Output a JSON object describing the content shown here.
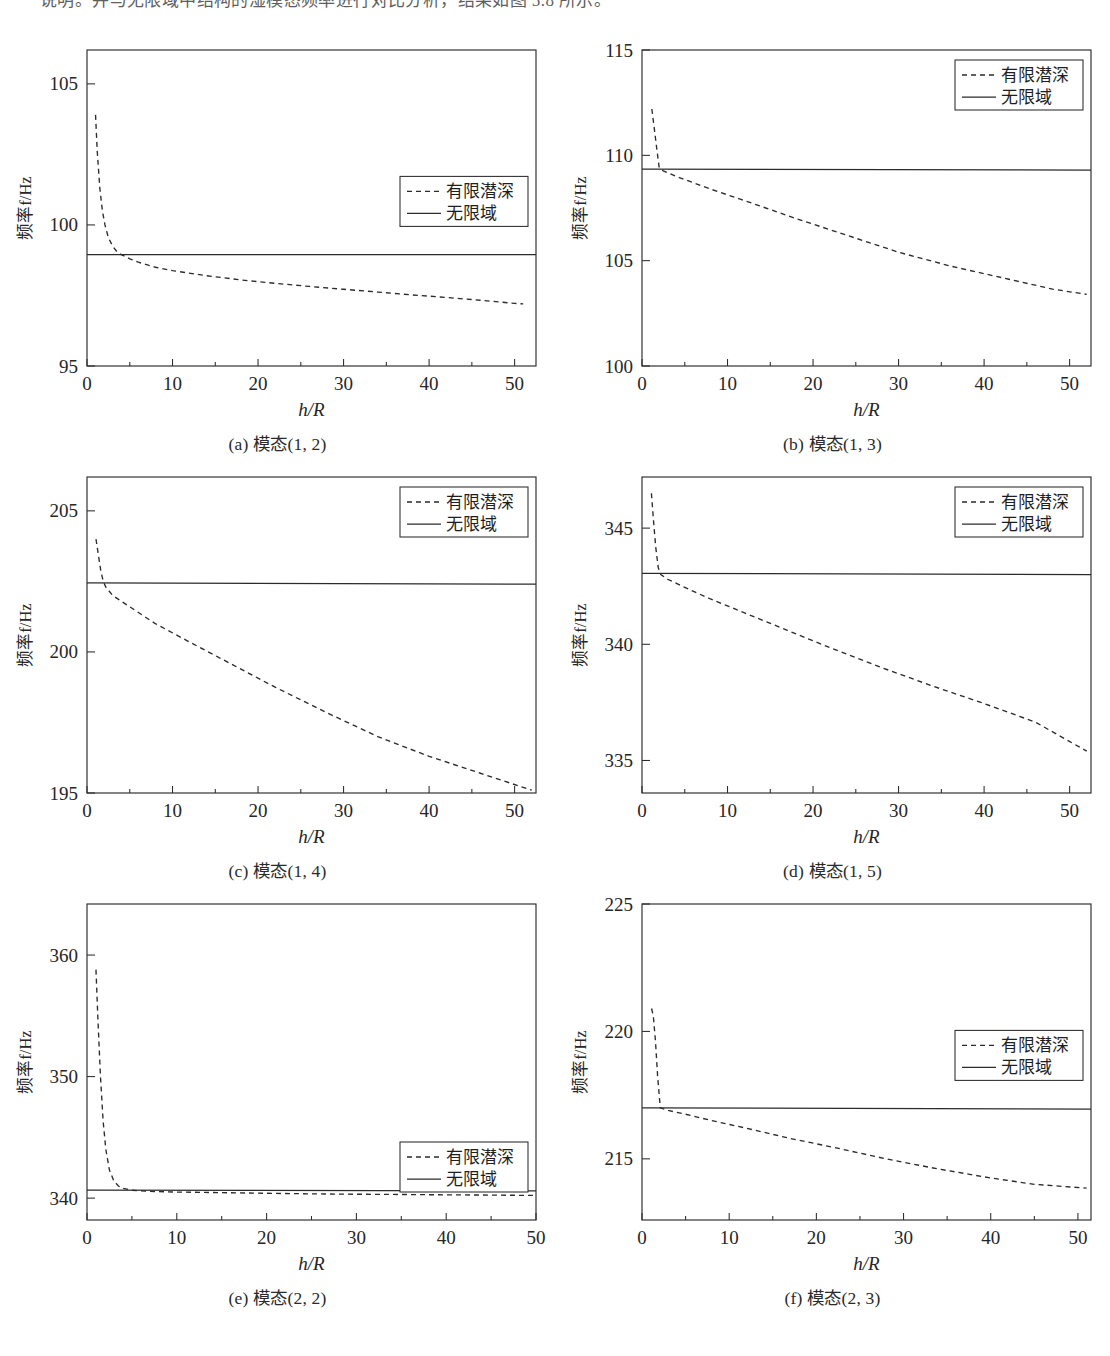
{
  "page": {
    "body_text_top": "说明。并与无限域中结构的湿模态频率进行对比分析，结果如图 5.8 所示。"
  },
  "legend": {
    "dashed_label": "有限潜深",
    "solid_label": "无限域"
  },
  "axes": {
    "xlabel": "h/R",
    "ylabel": "频率f/Hz"
  },
  "captions": {
    "a": "(a) 模态(1, 2)",
    "b": "(b) 模态(1, 3)",
    "c": "(c) 模态(1, 4)",
    "d": "(d) 模态(1, 5)",
    "e": "(e) 模态(2, 2)",
    "f": "(f) 模态(2, 3)"
  },
  "chart_data": [
    {
      "id": "a",
      "type": "line",
      "title": "(a) 模态(1, 2)",
      "xlabel": "h/R",
      "ylabel": "频率f/Hz",
      "xlim": [
        0,
        52.5
      ],
      "ylim": [
        95,
        106.2
      ],
      "xticks": [
        0,
        10,
        20,
        30,
        40,
        50
      ],
      "xtick_labels": [
        "0",
        "10",
        "20",
        "30",
        "40",
        "50"
      ],
      "yticks": [
        95,
        100,
        105
      ],
      "ytick_labels": [
        "95",
        "100",
        "105"
      ],
      "minor_xticks": [
        5,
        15,
        25,
        35,
        45
      ],
      "grid": false,
      "legend_position": "right-middle",
      "series": [
        {
          "name": "有限潜深",
          "style": "dashed",
          "x": [
            1,
            1.2,
            1.5,
            1.8,
            2.1,
            2.5,
            3,
            3.5,
            4,
            5,
            6,
            8,
            10,
            14,
            18,
            22,
            26,
            30,
            34,
            38,
            42,
            46,
            50,
            51
          ],
          "values": [
            103.9,
            102.6,
            101.3,
            100.5,
            100.0,
            99.55,
            99.25,
            99.05,
            98.95,
            98.8,
            98.68,
            98.5,
            98.38,
            98.2,
            98.05,
            97.93,
            97.82,
            97.72,
            97.62,
            97.52,
            97.43,
            97.33,
            97.22,
            97.2
          ]
        },
        {
          "name": "无限域",
          "style": "solid",
          "x": [
            0,
            52.5
          ],
          "values": [
            98.95,
            98.95
          ]
        }
      ]
    },
    {
      "id": "b",
      "type": "line",
      "title": "(b) 模态(1, 3)",
      "xlabel": "h/R",
      "ylabel": "频率f/Hz",
      "xlim": [
        0,
        52.5
      ],
      "ylim": [
        100,
        115
      ],
      "xticks": [
        0,
        10,
        20,
        30,
        40,
        50
      ],
      "xtick_labels": [
        "0",
        "10",
        "20",
        "30",
        "40",
        "50"
      ],
      "yticks": [
        100,
        105,
        110,
        115
      ],
      "ytick_labels": [
        "100",
        "105",
        "110",
        "115"
      ],
      "minor_xticks": [
        5,
        15,
        25,
        35,
        45
      ],
      "grid": false,
      "legend_position": "top-right",
      "series": [
        {
          "name": "有限潜深",
          "style": "dashed",
          "x": [
            1.15,
            1.4,
            1.7,
            2.0,
            2.3,
            4,
            8,
            12,
            18,
            24,
            30,
            36,
            42,
            48,
            52
          ],
          "values": [
            112.2,
            111.4,
            110.4,
            109.45,
            109.3,
            109.0,
            108.4,
            107.85,
            107.0,
            106.2,
            105.4,
            104.75,
            104.2,
            103.65,
            103.4
          ]
        },
        {
          "name": "无限域",
          "style": "solid",
          "x": [
            0,
            52.5
          ],
          "values": [
            109.35,
            109.3
          ]
        }
      ]
    },
    {
      "id": "c",
      "type": "line",
      "title": "(c) 模态(1, 4)",
      "xlabel": "h/R",
      "ylabel": "频率f/Hz",
      "xlim": [
        0,
        52.5
      ],
      "ylim": [
        195,
        206.2
      ],
      "xticks": [
        0,
        10,
        20,
        30,
        40,
        50
      ],
      "xtick_labels": [
        "0",
        "10",
        "20",
        "30",
        "40",
        "50"
      ],
      "yticks": [
        195,
        200,
        205
      ],
      "ytick_labels": [
        "195",
        "200",
        "205"
      ],
      "minor_xticks": [
        5,
        15,
        25,
        35,
        45
      ],
      "grid": false,
      "legend_position": "top-right",
      "series": [
        {
          "name": "有限潜深",
          "style": "dashed",
          "x": [
            1.05,
            1.3,
            1.6,
            1.9,
            2.2,
            3,
            5,
            8,
            12,
            17,
            22,
            28,
            34,
            40,
            46,
            52
          ],
          "values": [
            204.0,
            203.5,
            202.9,
            202.5,
            202.3,
            202.0,
            201.6,
            201.0,
            200.35,
            199.55,
            198.75,
            197.85,
            197.0,
            196.3,
            195.7,
            195.1
          ]
        },
        {
          "name": "无限域",
          "style": "solid",
          "x": [
            0,
            52.5
          ],
          "values": [
            202.45,
            202.4
          ]
        }
      ]
    },
    {
      "id": "d",
      "type": "line",
      "title": "(d) 模态(1, 5)",
      "xlabel": "h/R",
      "ylabel": "频率f/Hz",
      "xlim": [
        0,
        52.5
      ],
      "ylim": [
        333.6,
        347.2
      ],
      "xticks": [
        0,
        10,
        20,
        30,
        40,
        50
      ],
      "xtick_labels": [
        "0",
        "10",
        "20",
        "30",
        "40",
        "50"
      ],
      "yticks": [
        335,
        340,
        345
      ],
      "ytick_labels": [
        "335",
        "340",
        "345"
      ],
      "minor_xticks": [
        5,
        15,
        25,
        35,
        45
      ],
      "grid": false,
      "legend_position": "top-right",
      "series": [
        {
          "name": "有限潜深",
          "style": "dashed",
          "x": [
            1.1,
            1.35,
            1.6,
            1.9,
            2.2,
            3,
            5,
            8,
            12,
            17,
            22,
            28,
            34,
            40,
            46,
            52
          ],
          "values": [
            346.5,
            345.3,
            344.2,
            343.3,
            343.0,
            342.8,
            342.45,
            341.95,
            341.35,
            340.6,
            339.85,
            339.0,
            338.2,
            337.45,
            336.65,
            335.4
          ]
        },
        {
          "name": "无限域",
          "style": "solid",
          "x": [
            0,
            52.5
          ],
          "values": [
            343.05,
            343.0
          ]
        }
      ]
    },
    {
      "id": "e",
      "type": "line",
      "title": "(e) 模态(2, 2)",
      "xlabel": "h/R",
      "ylabel": "频率f/Hz",
      "xlim": [
        0,
        50
      ],
      "ylim": [
        338.2,
        364.2
      ],
      "xticks": [
        0,
        10,
        20,
        30,
        40,
        50
      ],
      "xtick_labels": [
        "0",
        "10",
        "20",
        "30",
        "40",
        "50"
      ],
      "yticks": [
        340,
        350,
        360
      ],
      "ytick_labels": [
        "340",
        "350",
        "360"
      ],
      "minor_xticks": [
        5,
        15,
        25,
        35,
        45
      ],
      "grid": false,
      "legend_position": "bottom-right",
      "series": [
        {
          "name": "有限潜深",
          "style": "dashed",
          "x": [
            1,
            1.2,
            1.5,
            1.8,
            2.1,
            2.5,
            3,
            3.5,
            4,
            5,
            7,
            10,
            15,
            20,
            25,
            30,
            35,
            40,
            45,
            50
          ],
          "values": [
            358.8,
            355.0,
            350.0,
            346.3,
            344.0,
            342.3,
            341.4,
            341.0,
            340.8,
            340.65,
            340.55,
            340.5,
            340.45,
            340.4,
            340.35,
            340.32,
            340.3,
            340.27,
            340.25,
            340.22
          ]
        },
        {
          "name": "无限域",
          "style": "solid",
          "x": [
            0,
            50
          ],
          "values": [
            340.65,
            340.6
          ]
        }
      ]
    },
    {
      "id": "f",
      "type": "line",
      "title": "(f) 模态(2, 3)",
      "xlabel": "h/R",
      "ylabel": "频率f/Hz",
      "xlim": [
        0,
        51.5
      ],
      "ylim": [
        212.6,
        225
      ],
      "xticks": [
        0,
        10,
        20,
        30,
        40,
        50
      ],
      "xtick_labels": [
        "0",
        "10",
        "20",
        "30",
        "40",
        "50"
      ],
      "yticks": [
        215,
        220,
        225
      ],
      "ytick_labels": [
        "215",
        "220",
        "225"
      ],
      "minor_xticks": [
        5,
        15,
        25,
        35,
        45
      ],
      "grid": false,
      "legend_position": "right-middle",
      "series": [
        {
          "name": "有限潜深",
          "style": "dashed",
          "x": [
            1.1,
            1.3,
            1.55,
            1.8,
            2.1,
            3,
            5,
            8,
            12,
            17,
            22,
            28,
            34,
            40,
            45,
            51
          ],
          "values": [
            220.9,
            220.6,
            219.6,
            218.2,
            217.0,
            216.9,
            216.75,
            216.5,
            216.2,
            215.8,
            215.45,
            215.0,
            214.6,
            214.25,
            214.0,
            213.85
          ]
        },
        {
          "name": "无限域",
          "style": "solid",
          "x": [
            0,
            51.5
          ],
          "values": [
            217.0,
            216.95
          ]
        }
      ]
    }
  ]
}
